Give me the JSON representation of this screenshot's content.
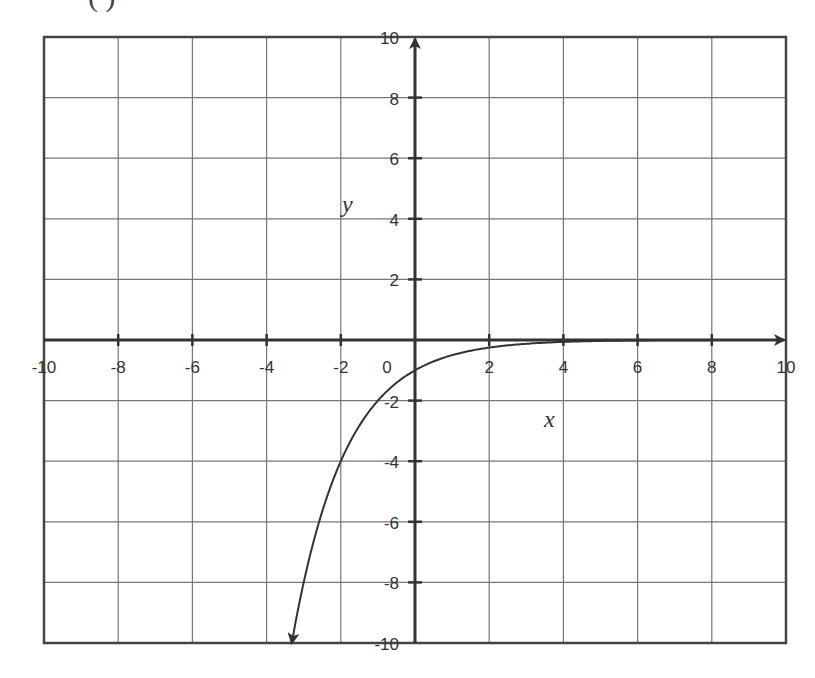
{
  "chart_data": {
    "type": "line",
    "title": "",
    "top_label": "( )",
    "xlabel": "x",
    "ylabel": "y",
    "xlim": [
      -10,
      10
    ],
    "ylim": [
      -10,
      10
    ],
    "grid": true,
    "grid_step": 2,
    "x_ticks": [
      -10,
      -8,
      -6,
      -4,
      -2,
      0,
      2,
      4,
      6,
      8,
      10
    ],
    "y_ticks": [
      -10,
      -8,
      -6,
      -4,
      -2,
      2,
      4,
      6,
      8,
      10
    ],
    "x_tick_labels": [
      "-10",
      "-8",
      "-6",
      "-4",
      "-2",
      "0",
      "2",
      "4",
      "6",
      "8",
      "10"
    ],
    "y_tick_labels": [
      "-10",
      "-8",
      "-6",
      "-4",
      "-2",
      "2",
      "4",
      "6",
      "8",
      "10"
    ],
    "series": [
      {
        "name": "curve",
        "function": "y = -2^(-x)",
        "x": [
          -3.32,
          -3,
          -2.5,
          -2,
          -1.5,
          -1,
          -0.5,
          0,
          0.5,
          1,
          1.5,
          2,
          3,
          4,
          5,
          6,
          7,
          8,
          9,
          10
        ],
        "y": [
          -10,
          -8,
          -5.66,
          -4,
          -2.83,
          -2,
          -1.41,
          -1,
          -0.71,
          -0.5,
          -0.35,
          -0.25,
          -0.125,
          -0.06,
          -0.03,
          -0.016,
          -0.008,
          -0.004,
          -0.002,
          -0.001
        ],
        "arrow_start": true,
        "color": "#333333"
      }
    ],
    "legend": null
  },
  "colors": {
    "grid": "#777777",
    "axis": "#333333",
    "curve": "#333333",
    "text": "#333333"
  }
}
